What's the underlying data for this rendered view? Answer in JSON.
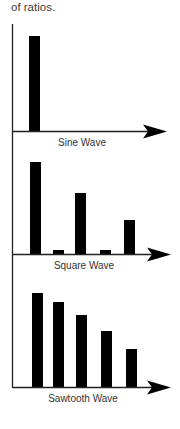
{
  "intro_text": "of ratios.",
  "colors": {
    "bar": "#000000",
    "axis": "#222222",
    "label": "#333333",
    "background": "#ffffff"
  },
  "chart_data": [
    {
      "type": "bar",
      "title": "Sine Wave",
      "xlabel": "Sine Wave",
      "ylabel": "",
      "categories": [
        "1",
        "2",
        "3",
        "4",
        "5"
      ],
      "values": [
        1.0,
        0,
        0,
        0,
        0
      ],
      "ylim": [
        0,
        1.05
      ],
      "grid": false,
      "legend": "none"
    },
    {
      "type": "bar",
      "title": "Square Wave",
      "xlabel": "Square Wave",
      "ylabel": "",
      "categories": [
        "1",
        "2",
        "3",
        "4",
        "5"
      ],
      "values": [
        1.0,
        0.04,
        0.66,
        0.04,
        0.37
      ],
      "ylim": [
        0,
        1.05
      ],
      "grid": false,
      "legend": "none"
    },
    {
      "type": "bar",
      "title": "Sawtooth Wave",
      "xlabel": "Sawtooth Wave",
      "ylabel": "",
      "categories": [
        "1",
        "2",
        "3",
        "4",
        "5"
      ],
      "values": [
        1.0,
        0.9,
        0.77,
        0.6,
        0.4
      ],
      "ylim": [
        0,
        1.05
      ],
      "grid": false,
      "legend": "none"
    }
  ]
}
